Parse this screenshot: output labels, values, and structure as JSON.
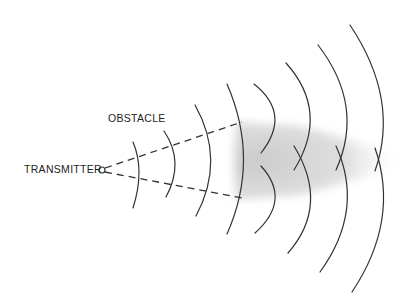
{
  "labels": {
    "obstacle": "OBSTACLE",
    "transmitter": "TRANSMITTER"
  },
  "colors": {
    "stroke": "#333333",
    "shadow": "#cfcfcf",
    "background": "#ffffff"
  },
  "diagram": {
    "transmitter": {
      "x": 102,
      "y": 170
    },
    "wavefront_count": 8,
    "obstacle_edges": [
      {
        "x": 242,
        "y": 122
      },
      {
        "x": 242,
        "y": 198
      }
    ]
  }
}
